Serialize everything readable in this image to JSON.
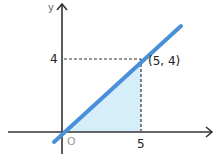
{
  "diagram": {
    "axes": {
      "x_label": "",
      "y_label": "y",
      "origin_label": "O"
    },
    "ticks": {
      "x": "5",
      "y": "4"
    },
    "point_label": "(5, 4)",
    "line": {
      "equation": "y = 0.8x",
      "color": "#4a90d9"
    },
    "shaded_region": {
      "description": "triangle under line from x=0 to x=5",
      "color": "#d6eefa"
    }
  }
}
